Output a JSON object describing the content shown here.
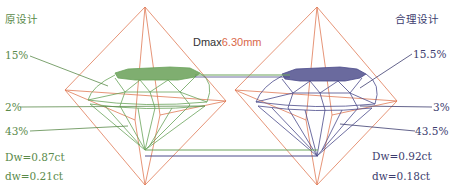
{
  "left": {
    "title": "原设计",
    "table_pct": "15%",
    "crown_pct": "2%",
    "pavilion_pct": "43%",
    "Dw": "Dw=0.87ct",
    "dw": "dw=0.21ct",
    "color": "#6aa35a"
  },
  "right": {
    "title": "合理设计",
    "table_pct": "15.5%",
    "crown_pct": "3%",
    "pavilion_pct": "43.5%",
    "Dw": "Dw=0.92ct",
    "dw": "dw=0.18ct",
    "color": "#4a4a8a"
  },
  "center": {
    "dmax_label": "Dmax",
    "dmax_value": "6.30mm"
  },
  "colors": {
    "octahedron": "#e07a55",
    "left_diamond": "#6aa35a",
    "right_diamond": "#4a4a8a"
  }
}
